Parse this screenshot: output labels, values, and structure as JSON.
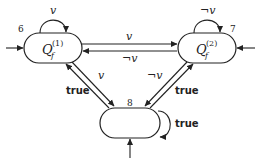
{
  "diagram": {
    "type": "state-machine",
    "nodes": [
      {
        "id": "6",
        "number": "6",
        "name": "Q",
        "subscript": "f",
        "superscript": "(1)",
        "self_loop_label": "v",
        "initial": true
      },
      {
        "id": "7",
        "number": "7",
        "name": "Q",
        "subscript": "f",
        "superscript": "(2)",
        "self_loop_label": "¬v",
        "initial": true
      },
      {
        "id": "8",
        "number": "8",
        "name": "",
        "self_loop_label": "true",
        "initial": true
      }
    ],
    "edges": [
      {
        "from": "6",
        "to": "7",
        "label": "v"
      },
      {
        "from": "7",
        "to": "6",
        "label": "¬v"
      },
      {
        "from": "8",
        "to": "6",
        "label": "true"
      },
      {
        "from": "6",
        "to": "8",
        "label": "v"
      },
      {
        "from": "8",
        "to": "7",
        "label": "true"
      },
      {
        "from": "7",
        "to": "8",
        "label": "¬v"
      },
      {
        "from": "8",
        "to": "8",
        "label": "true"
      }
    ]
  },
  "labels": {
    "n6": "6",
    "n7": "7",
    "n8": "8",
    "q": "Q",
    "f": "f",
    "sup1": "(1)",
    "sup2": "(2)",
    "loop6": "v",
    "loop7": "¬v",
    "loop8": "true",
    "e67": "v",
    "e76": "¬v",
    "e68": "v",
    "e86": "true",
    "e78": "¬v",
    "e87": "true"
  }
}
